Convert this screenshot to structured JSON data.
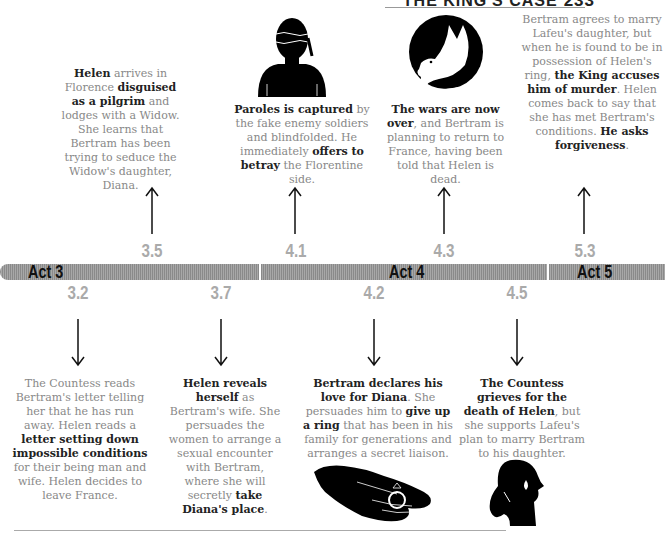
{
  "running_header": {
    "title": "THE KING'S CASE",
    "page_number": "233"
  },
  "acts": [
    {
      "label": "Act 3"
    },
    {
      "label": "Act 4"
    },
    {
      "label": "Act 5"
    }
  ],
  "top_events": [
    {
      "scene": "3.5",
      "segments": [
        {
          "b": "Helen"
        },
        {
          "t": " arrives in Florence "
        },
        {
          "b": "disguised as a pilgrim"
        },
        {
          "t": " and lodges with a Widow. She learns that Bertram has been trying to seduce the Widow's daughter, Diana."
        }
      ]
    },
    {
      "scene": "4.1",
      "icon": "blindfolded-man-icon",
      "segments": [
        {
          "b": "Paroles is captured"
        },
        {
          "t": " by the fake enemy soldiers and blindfolded. He immediately "
        },
        {
          "b": "offers to betray"
        },
        {
          "t": " the Florentine side."
        }
      ]
    },
    {
      "scene": "4.3",
      "icon": "dove-icon",
      "segments": [
        {
          "b": "The wars are now over"
        },
        {
          "t": ", and Bertram is planning to return to France, having been told that Helen is dead."
        }
      ]
    },
    {
      "scene": "5.3",
      "segments": [
        {
          "t": "Bertram agrees to marry Lafeu's daughter, but when he is found to be in possession of Helen's ring, "
        },
        {
          "b": "the King accuses him of murder"
        },
        {
          "t": ". Helen comes back to say that she has met Bertram's conditions. "
        },
        {
          "b": "He asks forgiveness"
        },
        {
          "t": "."
        }
      ]
    }
  ],
  "bottom_events": [
    {
      "scene": "3.2",
      "segments": [
        {
          "t": "The Countess reads Bertram's letter telling her that he has run away. Helen reads a "
        },
        {
          "b": "letter setting down impossible conditions"
        },
        {
          "t": " for their being man and wife. Helen decides to leave France."
        }
      ]
    },
    {
      "scene": "3.7",
      "segments": [
        {
          "b": "Helen reveals herself"
        },
        {
          "t": " as Bertram's wife. She persuades the women to arrange a sexual encounter with Bertram, where she will secretly "
        },
        {
          "b": "take Diana's place"
        },
        {
          "t": "."
        }
      ]
    },
    {
      "scene": "4.2",
      "icon": "hand-with-ring-icon",
      "segments": [
        {
          "b": "Bertram declares his love for Diana"
        },
        {
          "t": ". She persuades him to "
        },
        {
          "b": "give up a ring"
        },
        {
          "t": " that has been in his family for generations and arranges a secret liaison."
        }
      ]
    },
    {
      "scene": "4.5",
      "icon": "crying-woman-icon",
      "segments": [
        {
          "b": "The Countess grieves for the death of Helen"
        },
        {
          "t": ", but she supports Lafeu's plan to marry Bertram to his daughter."
        }
      ]
    }
  ],
  "colors": {
    "text_body": "#888888",
    "text_bold": "#222222",
    "scene_number": "#aaaaaa",
    "act_bar": "#999999"
  }
}
